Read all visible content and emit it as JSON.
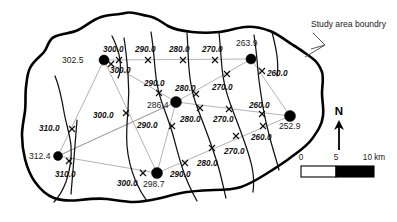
{
  "map": {
    "title": "Groundwater elevation contour map of study area",
    "annotation": {
      "study_boundary_label": "Study area boundry"
    },
    "north_arrow": {
      "label": "N"
    },
    "scale_bar": {
      "ticks": [
        "0",
        "5",
        "10 km"
      ],
      "unit": "km",
      "min": 0,
      "mid": 5,
      "max": 10
    },
    "colors": {
      "boundary": "#000000",
      "contour": "#111111",
      "tin_edge": "#9a9a9a",
      "well": "#000000",
      "background": "#ffffff",
      "scale_fill": "#000000"
    },
    "wells": [
      {
        "id": "w1",
        "label": "302.5",
        "value": 302.5,
        "x": 104,
        "y": 60,
        "label_x": 62,
        "label_y": 63
      },
      {
        "id": "w2",
        "label": "263.9",
        "value": 263.9,
        "x": 251,
        "y": 59,
        "label_x": 238,
        "label_y": 46
      },
      {
        "id": "w3",
        "label": "286.4",
        "value": 286.4,
        "x": 176,
        "y": 102,
        "label_x": 148,
        "label_y": 108
      },
      {
        "id": "w4",
        "label": "252.9",
        "value": 252.9,
        "x": 290,
        "y": 116,
        "label_x": 281,
        "label_y": 128
      },
      {
        "id": "w5",
        "label": "312.4",
        "value": 312.4,
        "x": 58,
        "y": 156,
        "label_x": 33,
        "label_y": 159
      },
      {
        "id": "w6",
        "label": "298.7",
        "value": 298.7,
        "x": 157,
        "y": 173,
        "label_x": 145,
        "label_y": 186
      }
    ],
    "contour_labels": [
      {
        "text": "300.0",
        "value": 300.0,
        "x": 112,
        "y": 49
      },
      {
        "text": "290.0",
        "value": 290.0,
        "x": 142,
        "y": 49
      },
      {
        "text": "280.0",
        "value": 280.0,
        "x": 175,
        "y": 49
      },
      {
        "text": "270.0",
        "value": 270.0,
        "x": 208,
        "y": 49
      },
      {
        "text": "300.0",
        "value": 300.0,
        "x": 113,
        "y": 71
      },
      {
        "text": "260.0",
        "value": 260.0,
        "x": 268,
        "y": 74
      },
      {
        "text": "290.0",
        "value": 290.0,
        "x": 150,
        "y": 83
      },
      {
        "text": "280.0",
        "value": 280.0,
        "x": 180,
        "y": 88
      },
      {
        "text": "270.0",
        "value": 270.0,
        "x": 218,
        "y": 87
      },
      {
        "text": "260.0",
        "value": 260.0,
        "x": 253,
        "y": 106
      },
      {
        "text": "300.0",
        "value": 300.0,
        "x": 99,
        "y": 116
      },
      {
        "text": "280.0",
        "value": 280.0,
        "x": 186,
        "y": 120
      },
      {
        "text": "270.0",
        "value": 270.0,
        "x": 219,
        "y": 120
      },
      {
        "text": "290.0",
        "value": 290.0,
        "x": 143,
        "y": 126
      },
      {
        "text": "310.0",
        "value": 310.0,
        "x": 45,
        "y": 128
      },
      {
        "text": "260.0",
        "value": 260.0,
        "x": 255,
        "y": 138
      },
      {
        "text": "270.0",
        "value": 270.0,
        "x": 229,
        "y": 152
      },
      {
        "text": "310.0",
        "value": 310.0,
        "x": 60,
        "y": 175
      },
      {
        "text": "280.0",
        "value": 280.0,
        "x": 203,
        "y": 164
      },
      {
        "text": "290.0",
        "value": 290.0,
        "x": 177,
        "y": 175
      },
      {
        "text": "300.0",
        "value": 300.0,
        "x": 123,
        "y": 184
      }
    ],
    "x_markers": [
      {
        "x": 119,
        "y": 60
      },
      {
        "x": 148,
        "y": 60
      },
      {
        "x": 183,
        "y": 60
      },
      {
        "x": 215,
        "y": 60
      },
      {
        "x": 262,
        "y": 71
      },
      {
        "x": 159,
        "y": 93
      },
      {
        "x": 196,
        "y": 94
      },
      {
        "x": 227,
        "y": 74
      },
      {
        "x": 200,
        "y": 108
      },
      {
        "x": 229,
        "y": 109
      },
      {
        "x": 262,
        "y": 114
      },
      {
        "x": 126,
        "y": 113
      },
      {
        "x": 172,
        "y": 126
      },
      {
        "x": 72,
        "y": 129
      },
      {
        "x": 263,
        "y": 126
      },
      {
        "x": 236,
        "y": 136
      },
      {
        "x": 233,
        "y": 121
      },
      {
        "x": 185,
        "y": 163
      },
      {
        "x": 69,
        "y": 161
      },
      {
        "x": 143,
        "y": 173
      },
      {
        "x": 212,
        "y": 148
      }
    ],
    "contour_intervals": [
      260.0,
      270.0,
      280.0,
      290.0,
      300.0,
      310.0
    ],
    "elevation_range": {
      "min": 252.9,
      "max": 312.4
    }
  }
}
